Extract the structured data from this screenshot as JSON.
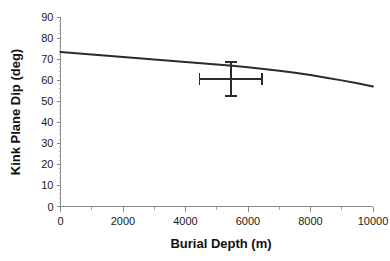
{
  "chart_data": {
    "type": "line",
    "title": "",
    "xlabel": "Burial Depth (m)",
    "ylabel": "Kink Plane Dip (deg)",
    "xlim": [
      0,
      10000
    ],
    "ylim": [
      0,
      90
    ],
    "x_major_ticks": [
      0,
      2000,
      4000,
      6000,
      8000,
      10000
    ],
    "x_tick_labels": [
      "0",
      "2000",
      "4000",
      "6000",
      "8000",
      "10000"
    ],
    "x_minor_tick_step": 1000,
    "y_major_ticks": [
      0,
      10,
      20,
      30,
      40,
      50,
      60,
      70,
      80,
      90
    ],
    "y_tick_labels": [
      "0",
      "10",
      "20",
      "30",
      "40",
      "50",
      "60",
      "70",
      "80",
      "90"
    ],
    "y_minor_tick_step": 2,
    "grid": false,
    "legend": null,
    "series": [
      {
        "name": "Kink plane dip vs burial depth",
        "color": "#2b2b2b",
        "x": [
          0,
          500,
          1000,
          1500,
          2000,
          2500,
          3000,
          3500,
          4000,
          4500,
          5000,
          5500,
          6000,
          6500,
          7000,
          7500,
          8000,
          8500,
          9000,
          9500,
          10000
        ],
        "y": [
          73.4,
          72.8,
          72.2,
          71.6,
          71.0,
          70.4,
          69.8,
          69.2,
          68.6,
          68.0,
          67.4,
          66.8,
          66.1,
          65.3,
          64.5,
          63.5,
          62.4,
          61.2,
          59.9,
          58.5,
          57.0
        ]
      }
    ],
    "error_bars": [
      {
        "name": "field measurement",
        "x": 5450,
        "y": 60.5,
        "x_low": 4450,
        "x_high": 6450,
        "y_low": 52.5,
        "y_high": 68.5,
        "color": "#2b2b2b"
      }
    ]
  },
  "figure": {
    "background": "#ffffff",
    "axis_color": "#8a8a8a",
    "text_color": "#1a1a1a"
  }
}
